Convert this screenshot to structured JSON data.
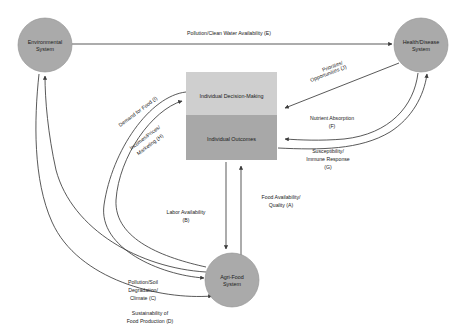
{
  "diagram": {
    "colors": {
      "circle_fill": "#aaaaaa",
      "rect_top_fill": "#cfcfcf",
      "rect_bottom_fill": "#a8a8a8",
      "edge_stroke": "#3b3b3b",
      "text": "#1a1a1a",
      "background": "#ffffff"
    },
    "nodes": [
      {
        "id": "environmental",
        "shape": "circle",
        "cx": 45,
        "cy": 45,
        "r": 27,
        "line1": "Environmental",
        "line2": "System"
      },
      {
        "id": "health-disease",
        "shape": "circle",
        "cx": 421,
        "cy": 45,
        "r": 27,
        "line1": "Health/Disease",
        "line2": "System"
      },
      {
        "id": "agri-food",
        "shape": "circle",
        "cx": 232,
        "cy": 280,
        "r": 27,
        "line1": "Agri-Food",
        "line2": "System"
      },
      {
        "id": "individual-decision-making",
        "shape": "rect-top",
        "x": 186,
        "y": 72,
        "w": 91,
        "h": 43,
        "label": "Individual Decision-Making"
      },
      {
        "id": "individual-outcomes",
        "shape": "rect-bottom",
        "x": 186,
        "y": 115,
        "w": 91,
        "h": 45,
        "label": "Individual  Outcomes"
      }
    ],
    "edges": [
      {
        "id": "A",
        "label_line1": "Food Availability/",
        "label_line2": "Quality (A)",
        "from": "agri-food",
        "to": "individual-outcomes"
      },
      {
        "id": "B",
        "label_line1": "Labor Availability",
        "label_line2": "(B)",
        "from": "individual-outcomes",
        "to": "agri-food"
      },
      {
        "id": "C",
        "label_line1": "Pollution/Soil",
        "label_line2": "Degradation/",
        "label_line3": "Climate (C)",
        "from": "agri-food",
        "to": "environmental"
      },
      {
        "id": "D",
        "label_line1": "Sustainability of",
        "label_line2": "Food Production (D)",
        "from": "environmental",
        "to": "agri-food"
      },
      {
        "id": "E",
        "label_line1": "Pollution/Clean Water Availability (E)",
        "from": "environmental",
        "to": "health-disease"
      },
      {
        "id": "F",
        "label_line1": "Nutrient Absorption",
        "label_line2": "(F)",
        "from": "individual-outcomes",
        "to": "health-disease"
      },
      {
        "id": "G",
        "label_line1": "Susceptibility/",
        "label_line2": "Immune Response",
        "label_line3": "(G)",
        "from": "health-disease",
        "to": "individual-outcomes"
      },
      {
        "id": "H",
        "label_line1": "Incomes/Prices/",
        "label_line2": "Marketing (H)",
        "from": "agri-food",
        "to": "individual-decision-making"
      },
      {
        "id": "I",
        "label_line1": "Demand for Food (I)",
        "from": "individual-decision-making",
        "to": "agri-food"
      },
      {
        "id": "J",
        "label_line1": "Priorities/",
        "label_line2": "Opportunities (J)",
        "from": "health-disease",
        "to": "individual-decision-making"
      }
    ]
  }
}
